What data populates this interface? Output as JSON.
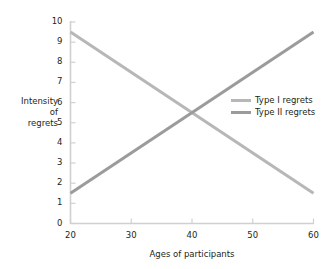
{
  "chart_data": {
    "type": "line",
    "title": "",
    "xlabel": "Ages of participants",
    "ylabel": "Intensity\nof\nregrets",
    "ylabel_lines": [
      "Intensity",
      "of",
      "regrets"
    ],
    "x": [
      20,
      60
    ],
    "xlim": [
      20,
      60
    ],
    "ylim": [
      0,
      10
    ],
    "xticks": [
      20,
      30,
      40,
      50,
      60
    ],
    "yticks": [
      0,
      1,
      2,
      3,
      4,
      5,
      6,
      7,
      8,
      9,
      10
    ],
    "xtick_labels": [
      "20",
      "30",
      "40",
      "50",
      "60"
    ],
    "ytick_labels": [
      "0",
      "1",
      "2",
      "3",
      "4",
      "5",
      "6",
      "7",
      "8",
      "9",
      "10"
    ],
    "grid": false,
    "legend_position": "inside-right",
    "series": [
      {
        "name": "Type I regrets",
        "x": [
          20,
          60
        ],
        "values": [
          9.5,
          1.5
        ],
        "color": "#b7b7b7",
        "linewidth": 3
      },
      {
        "name": "Type II regrets",
        "x": [
          20,
          60
        ],
        "values": [
          1.5,
          9.5
        ],
        "color": "#9b9b9b",
        "linewidth": 3
      }
    ],
    "annotations": [
      {
        "text": "crossing point",
        "x": 40,
        "y": 5.5
      }
    ]
  },
  "legend": {
    "items": [
      {
        "label": "Type I regrets",
        "color": "#b7b7b7"
      },
      {
        "label": "Type II regrets",
        "color": "#9b9b9b"
      }
    ]
  },
  "axes": {
    "line_color": "#d0d0d0",
    "tick_color": "#d0d0d0",
    "text_color": "#231f20"
  }
}
